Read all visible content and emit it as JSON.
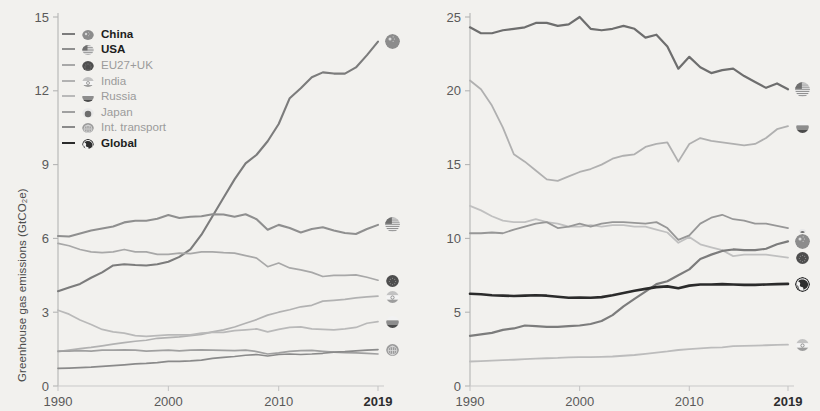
{
  "legend": {
    "items": [
      {
        "label": "China",
        "flag": "china",
        "color": "#7c7c7c",
        "bold": true
      },
      {
        "label": "USA",
        "flag": "usa",
        "color": "#8f8f8f",
        "bold": true
      },
      {
        "label": "EU27+UK",
        "flag": "eu",
        "color": "#a8a8a8",
        "bold": false
      },
      {
        "label": "India",
        "flag": "india",
        "color": "#b2b2b2",
        "bold": false
      },
      {
        "label": "Russia",
        "flag": "russia",
        "color": "#b9b9b9",
        "bold": false
      },
      {
        "label": "Japan",
        "flag": "japan",
        "color": "#a0a0a0",
        "bold": false
      },
      {
        "label": "Int. transport",
        "flag": "transport",
        "color": "#8a8a8a",
        "bold": false
      },
      {
        "label": "Global",
        "flag": "global",
        "color": "#2b2b2b",
        "bold": true
      }
    ]
  },
  "chart_data": [
    {
      "type": "line",
      "id": "total-emissions",
      "title": "",
      "xlabel": "",
      "ylabel": "Greenhouse gas emissions (GtCO₂e)",
      "xlim": [
        1990,
        2019
      ],
      "ylim": [
        0,
        15
      ],
      "yticks": [
        0,
        3,
        6,
        9,
        12,
        15
      ],
      "xticks": [
        1990,
        2000,
        2010,
        2019
      ],
      "xtick_labels": [
        "1990",
        "2000",
        "2010",
        "2019"
      ],
      "grid": false,
      "legend_position": "upper-left",
      "x": [
        1990,
        1991,
        1992,
        1993,
        1994,
        1995,
        1996,
        1997,
        1998,
        1999,
        2000,
        2001,
        2002,
        2003,
        2004,
        2005,
        2006,
        2007,
        2008,
        2009,
        2010,
        2011,
        2012,
        2013,
        2014,
        2015,
        2016,
        2017,
        2018,
        2019
      ],
      "series": [
        {
          "name": "China",
          "color": "#7c7c7c",
          "width": 2.1,
          "end_value": 14.0,
          "values": [
            3.85,
            4.0,
            4.15,
            4.4,
            4.62,
            4.9,
            4.95,
            4.92,
            4.9,
            4.95,
            5.05,
            5.25,
            5.55,
            6.15,
            6.9,
            7.65,
            8.4,
            9.05,
            9.4,
            9.95,
            10.65,
            11.7,
            12.1,
            12.55,
            12.75,
            12.7,
            12.7,
            12.95,
            13.45,
            14.0
          ]
        },
        {
          "name": "USA",
          "color": "#8f8f8f",
          "width": 2.1,
          "end_value": 6.55,
          "values": [
            6.1,
            6.08,
            6.2,
            6.32,
            6.4,
            6.48,
            6.65,
            6.72,
            6.72,
            6.8,
            6.95,
            6.83,
            6.88,
            6.9,
            6.98,
            6.97,
            6.88,
            6.98,
            6.78,
            6.35,
            6.55,
            6.42,
            6.24,
            6.38,
            6.45,
            6.32,
            6.22,
            6.18,
            6.38,
            6.55
          ]
        },
        {
          "name": "EU27+UK",
          "color": "#a8a8a8",
          "width": 1.7,
          "end_value": 4.3,
          "values": [
            5.8,
            5.7,
            5.55,
            5.45,
            5.42,
            5.45,
            5.55,
            5.45,
            5.45,
            5.35,
            5.35,
            5.4,
            5.38,
            5.45,
            5.45,
            5.42,
            5.4,
            5.3,
            5.2,
            4.85,
            5.0,
            4.8,
            4.72,
            4.62,
            4.45,
            4.5,
            4.5,
            4.52,
            4.42,
            4.3
          ]
        },
        {
          "name": "India",
          "color": "#b2b2b2",
          "width": 1.7,
          "end_value": 3.65,
          "values": [
            1.4,
            1.46,
            1.52,
            1.57,
            1.63,
            1.7,
            1.76,
            1.82,
            1.86,
            1.94,
            1.97,
            2.0,
            2.05,
            2.1,
            2.2,
            2.28,
            2.4,
            2.55,
            2.7,
            2.88,
            3.0,
            3.1,
            3.22,
            3.28,
            3.45,
            3.48,
            3.52,
            3.58,
            3.62,
            3.65
          ]
        },
        {
          "name": "Russia",
          "color": "#b9b9b9",
          "width": 1.7,
          "end_value": 2.62,
          "values": [
            3.08,
            2.92,
            2.68,
            2.5,
            2.3,
            2.2,
            2.15,
            2.05,
            2.02,
            2.05,
            2.08,
            2.08,
            2.08,
            2.15,
            2.18,
            2.18,
            2.25,
            2.28,
            2.32,
            2.2,
            2.3,
            2.38,
            2.4,
            2.32,
            2.3,
            2.28,
            2.32,
            2.38,
            2.55,
            2.62
          ]
        },
        {
          "name": "Japan",
          "color": "#a0a0a0",
          "width": 1.7,
          "end_value": 1.45,
          "values": [
            1.42,
            1.42,
            1.44,
            1.42,
            1.46,
            1.46,
            1.47,
            1.46,
            1.42,
            1.44,
            1.46,
            1.43,
            1.46,
            1.47,
            1.46,
            1.45,
            1.44,
            1.46,
            1.4,
            1.3,
            1.35,
            1.41,
            1.44,
            1.45,
            1.41,
            1.38,
            1.36,
            1.35,
            1.33,
            1.3
          ]
        },
        {
          "name": "Int. transport",
          "color": "#8a8a8a",
          "width": 1.7,
          "end_value": 1.48,
          "values": [
            0.72,
            0.73,
            0.75,
            0.77,
            0.8,
            0.83,
            0.86,
            0.9,
            0.92,
            0.95,
            1.0,
            1.0,
            1.02,
            1.05,
            1.12,
            1.16,
            1.2,
            1.25,
            1.28,
            1.22,
            1.28,
            1.3,
            1.28,
            1.3,
            1.33,
            1.38,
            1.4,
            1.43,
            1.46,
            1.48
          ]
        }
      ]
    },
    {
      "type": "line",
      "id": "per-capita-emissions",
      "title": "",
      "xlabel": "",
      "ylabel": "Per capita emissions (tCO₂e/capita)",
      "xlim": [
        1990,
        2019
      ],
      "ylim": [
        0,
        25
      ],
      "yticks": [
        0,
        5,
        10,
        15,
        20,
        25
      ],
      "xticks": [
        1990,
        2000,
        2010,
        2019
      ],
      "xtick_labels": [
        "1990",
        "2000",
        "2010",
        "2019"
      ],
      "grid": false,
      "legend_position": "none",
      "x": [
        1990,
        1991,
        1992,
        1993,
        1994,
        1995,
        1996,
        1997,
        1998,
        1999,
        2000,
        2001,
        2002,
        2003,
        2004,
        2005,
        2006,
        2007,
        2008,
        2009,
        2010,
        2011,
        2012,
        2013,
        2014,
        2015,
        2016,
        2017,
        2018,
        2019
      ],
      "series": [
        {
          "name": "USA",
          "color": "#6e6e6e",
          "width": 2.2,
          "end_value": 20.1,
          "values": [
            24.3,
            23.9,
            23.9,
            24.1,
            24.2,
            24.3,
            24.6,
            24.6,
            24.4,
            24.5,
            25.0,
            24.2,
            24.1,
            24.2,
            24.4,
            24.2,
            23.6,
            23.8,
            23.0,
            21.5,
            22.3,
            21.6,
            21.2,
            21.4,
            21.5,
            21.0,
            20.6,
            20.2,
            20.5,
            20.1
          ]
        },
        {
          "name": "Russia",
          "color": "#b0b0b0",
          "width": 1.8,
          "end_value": 17.6,
          "values": [
            20.7,
            20.1,
            19.0,
            17.5,
            15.7,
            15.2,
            14.6,
            14.0,
            13.9,
            14.2,
            14.5,
            14.7,
            15.0,
            15.4,
            15.6,
            15.7,
            16.2,
            16.4,
            16.5,
            15.2,
            16.4,
            16.8,
            16.6,
            16.5,
            16.4,
            16.3,
            16.4,
            16.8,
            17.4,
            17.6
          ]
        },
        {
          "name": "EU27+UK",
          "color": "#c0c0c0",
          "width": 1.8,
          "end_value": 8.7,
          "values": [
            12.2,
            11.9,
            11.5,
            11.2,
            11.1,
            11.1,
            11.3,
            11.1,
            11.0,
            10.8,
            10.8,
            10.9,
            10.8,
            10.9,
            10.9,
            10.8,
            10.8,
            10.6,
            10.4,
            9.7,
            10.1,
            9.6,
            9.4,
            9.2,
            8.8,
            8.9,
            8.9,
            8.9,
            8.8,
            8.7
          ]
        },
        {
          "name": "Japan",
          "color": "#979797",
          "width": 1.8,
          "end_value": 10.7,
          "values": [
            10.35,
            10.35,
            10.4,
            10.35,
            10.6,
            10.8,
            11.0,
            11.1,
            10.7,
            10.8,
            11.0,
            10.8,
            11.0,
            11.1,
            11.1,
            11.05,
            11.0,
            11.1,
            10.7,
            9.9,
            10.2,
            11.0,
            11.4,
            11.6,
            11.3,
            11.2,
            11.0,
            11.0,
            10.85,
            10.7
          ]
        },
        {
          "name": "China",
          "color": "#7c7c7c",
          "width": 2.2,
          "end_value": 9.8,
          "values": [
            3.4,
            3.5,
            3.6,
            3.8,
            3.9,
            4.1,
            4.05,
            4.0,
            4.0,
            4.05,
            4.1,
            4.2,
            4.4,
            4.8,
            5.4,
            5.9,
            6.4,
            6.9,
            7.1,
            7.5,
            7.9,
            8.6,
            8.9,
            9.15,
            9.25,
            9.2,
            9.2,
            9.3,
            9.6,
            9.8
          ]
        },
        {
          "name": "India",
          "color": "#bcbcbc",
          "width": 1.8,
          "end_value": 2.8,
          "values": [
            1.66,
            1.69,
            1.72,
            1.75,
            1.78,
            1.82,
            1.85,
            1.88,
            1.9,
            1.94,
            1.95,
            1.96,
            1.98,
            2.0,
            2.05,
            2.1,
            2.18,
            2.26,
            2.34,
            2.44,
            2.5,
            2.55,
            2.6,
            2.62,
            2.7,
            2.72,
            2.74,
            2.76,
            2.78,
            2.8
          ]
        },
        {
          "name": "Global",
          "color": "#2b2b2b",
          "width": 2.6,
          "end_value": 6.9,
          "values": [
            6.25,
            6.22,
            6.15,
            6.12,
            6.1,
            6.12,
            6.15,
            6.12,
            6.05,
            5.98,
            6.0,
            5.98,
            6.02,
            6.15,
            6.3,
            6.45,
            6.58,
            6.7,
            6.75,
            6.62,
            6.8,
            6.88,
            6.88,
            6.9,
            6.88,
            6.85,
            6.85,
            6.88,
            6.9,
            6.92
          ]
        }
      ]
    }
  ]
}
